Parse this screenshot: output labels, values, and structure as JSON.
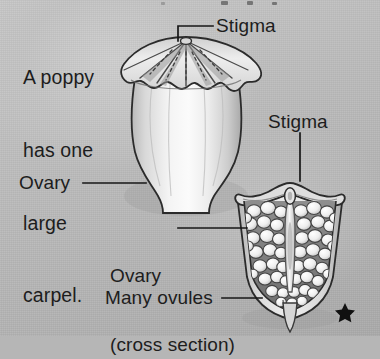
{
  "figure": {
    "background_color": "#bdbdbd",
    "ink_color": "#1d1d1d"
  },
  "caption": {
    "lines": [
      "A poppy",
      "has one",
      "large",
      "carpel."
    ],
    "full_text": "A poppy has one large carpel."
  },
  "labels": {
    "stigma_top": "Stigma",
    "stigma_cross": "Stigma",
    "ovary": "Ovary",
    "ovary_cross_line1": "Ovary",
    "ovary_cross_line2": "(cross section)",
    "many_ovules": "Many ovules"
  },
  "illustrations": {
    "whole_carpel": {
      "name": "whole poppy carpel",
      "parts": [
        "stigma disc",
        "ovary body"
      ],
      "fill": "#e9e9e9",
      "outline": "#2a2a2a"
    },
    "cross_section": {
      "name": "poppy ovary cross section",
      "parts": [
        "stigma cap",
        "ovary wall",
        "ovules",
        "central column"
      ],
      "ovule_count_shown": 54,
      "fill": "#e2e2e2",
      "outline": "#2b2b2b"
    }
  },
  "marks": {
    "corner_star": "★"
  }
}
